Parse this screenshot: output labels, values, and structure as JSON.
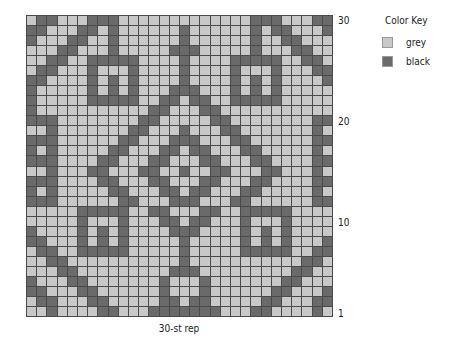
{
  "chart": {
    "columns": 30,
    "rows": 30,
    "colors": {
      "grey": "#c8c8c8",
      "black": "#6a6a6a",
      "gridline": "#4a4a4a"
    },
    "row_labels": [
      {
        "row": 30,
        "label": "30"
      },
      {
        "row": 20,
        "label": "20"
      },
      {
        "row": 10,
        "label": "10"
      },
      {
        "row": 1,
        "label": "1"
      }
    ],
    "left_halves_top_to_bottom": [
      ".XX...XXX.......",
      "XX...XX.X......X",
      "X...XX..X......X",
      "...XX...X.....XX",
      "..XX..XXXXX....X",
      ".XX...X...X....X",
      "XX....X.X.X....X",
      "X.....X.X.X...XX",
      "X.....XXXXX..XX.",
      "X...........XX..",
      "XXX........XX...",
      "..X.......XX...X",
      "XXX......XX...XX",
      "X.X.....XX...XX.",
      "XXX....XX...XX..",
      "..X...XX...XX..X",
      "XXX....XX...XX..",
      "X.X.....XX...XX.",
      "XXX......XX...XX",
      ".....XXXXX..XX..",
      ".....X...X...XX.",
      "X....X.X.X....XX",
      "XX...X.X.X.....X",
      ".XX..XXXXX.....X",
      "..XX...........X",
      "...XX.........XX",
      "X...XX.......X..",
      "XX...XX......X..",
      ".XX...XX.....XX.",
      "..X....XX...XXXX"
    ],
    "symmetry": "mirrored about column 16"
  },
  "key": {
    "title": "Color Key",
    "items": [
      {
        "label": "grey",
        "color": "#c8c8c8"
      },
      {
        "label": "black",
        "color": "#6a6a6a"
      }
    ]
  },
  "footer": {
    "label": "30-st rep"
  }
}
